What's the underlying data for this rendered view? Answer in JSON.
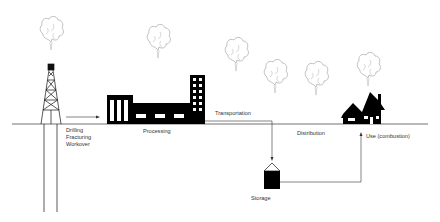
{
  "diagram": {
    "stages": [
      {
        "id": "well",
        "label_lines": [
          "Drilling",
          "Fracturing",
          "Workover"
        ],
        "icon": "drilling-rig-icon"
      },
      {
        "id": "processing",
        "label": "Processing",
        "icon": "factory-icon"
      },
      {
        "id": "transportation",
        "label": "Transportation"
      },
      {
        "id": "storage",
        "label": "Storage",
        "icon": "storage-tank-icon"
      },
      {
        "id": "distribution",
        "label": "Distribution"
      },
      {
        "id": "use",
        "label": "Use (combustion)",
        "icon": "house-icon"
      }
    ],
    "emission_plumes": 6,
    "colors": {
      "line": "#333333",
      "fill": "#000000",
      "plume": "#999999",
      "background": "#ffffff"
    }
  }
}
